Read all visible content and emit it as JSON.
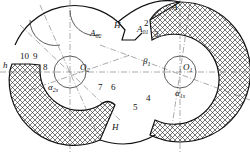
{
  "diagram": {
    "type": "twin-screw rotor cross-section",
    "labels": {
      "A": "A",
      "A01": "A",
      "A01_sub": "01",
      "A02": "A",
      "A02_sub": "02",
      "H_top": "H",
      "H_bottom": "H",
      "h": "h",
      "O1": "O",
      "O1_sub": "1",
      "O2": "O",
      "O2_sub": "2",
      "beta1": "β",
      "beta1_sub": "1",
      "alpha1s": "α",
      "alpha1s_sub": "1s",
      "alpha2s": "α",
      "alpha2s_sub": "2s"
    },
    "points": [
      "2",
      "3",
      "4",
      "5",
      "6",
      "7",
      "8",
      "9",
      "10"
    ],
    "colors": {
      "line": "#111111",
      "hatch": "#222222",
      "background": "#ffffff"
    }
  }
}
